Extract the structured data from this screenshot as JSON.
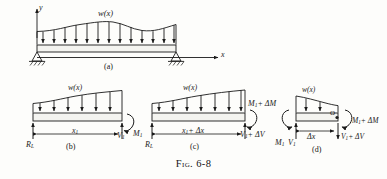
{
  "figure": {
    "caption_prefix": "Fig.",
    "caption_number": "6-8",
    "caption_full": "FIG. 6-8"
  },
  "panels": {
    "a": {
      "label": "(a)",
      "load_label": "w(x)",
      "axis_y": "y",
      "axis_x": "x",
      "description": "simply supported beam with distributed load w(x)"
    },
    "b": {
      "label": "(b)",
      "load_label": "w(x)",
      "reaction_left": "R",
      "reaction_left_sub": "L",
      "distance": "x",
      "distance_sub": "1",
      "shear": "V",
      "shear_sub": "1",
      "moment": "M",
      "moment_sub": "1"
    },
    "c": {
      "label": "(c)",
      "load_label": "w(x)",
      "reaction_left": "R",
      "reaction_left_sub": "L",
      "distance": "x",
      "distance_sub": "1",
      "distance_delta": "+ Δx",
      "moment": "M",
      "moment_sub": "1",
      "moment_delta": "+ ΔM",
      "shear": "V",
      "shear_sub": "1",
      "shear_delta": "+ ΔV"
    },
    "d": {
      "label": "(d)",
      "load_label": "w(x)",
      "origin_point": "O",
      "element_width": "Δx",
      "left_moment": "M",
      "left_moment_sub": "1",
      "left_shear": "V",
      "left_shear_sub": "1",
      "right_moment": "M",
      "right_moment_sub": "1",
      "right_moment_delta": "+ ΔM",
      "right_shear": "V",
      "right_shear_sub": "1",
      "right_shear_delta": "+ ΔV"
    }
  },
  "colors": {
    "ink": "#1a1a1a",
    "paper": "#fdfdfb",
    "beam_fill": "#f2f2ee"
  }
}
